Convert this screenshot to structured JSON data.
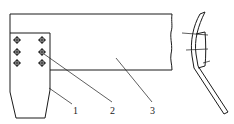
{
  "diagram": {
    "type": "technical-line-drawing",
    "stroke_color": "#1a1a1a",
    "background": "#ffffff",
    "parts": [
      {
        "id": "1",
        "label": "1",
        "name": "plate"
      },
      {
        "id": "2",
        "label": "2",
        "name": "bolt"
      },
      {
        "id": "3",
        "label": "3",
        "name": "beam"
      }
    ],
    "bolts": {
      "columns": 2,
      "rows": 3,
      "positions": [
        [
          17,
          40
        ],
        [
          42,
          40
        ],
        [
          17,
          52
        ],
        [
          42,
          52
        ],
        [
          17,
          63
        ],
        [
          42,
          63
        ]
      ]
    },
    "side_view": {
      "bolt_lines": 3
    }
  }
}
